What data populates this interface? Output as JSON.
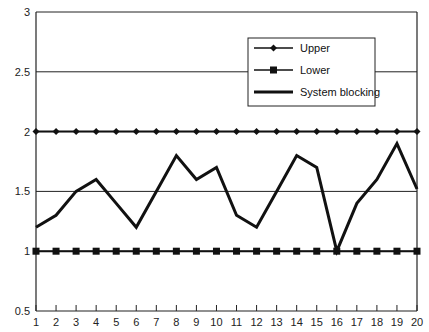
{
  "chart_data": {
    "type": "line",
    "title": "",
    "xlabel": "",
    "ylabel": "",
    "x": [
      1,
      2,
      3,
      4,
      5,
      6,
      7,
      8,
      9,
      10,
      11,
      12,
      13,
      14,
      15,
      16,
      17,
      18,
      19,
      20
    ],
    "ylim": [
      0.5,
      3
    ],
    "yticks": [
      0.5,
      1,
      1.5,
      2,
      2.5,
      3
    ],
    "ytick_labels": [
      "0.5",
      "1",
      "1.5",
      "2",
      "2.5",
      "3"
    ],
    "grid": "horizontal",
    "legend_position": "upper right",
    "series": [
      {
        "name": "Upper",
        "marker": "diamond",
        "values": [
          2,
          2,
          2,
          2,
          2,
          2,
          2,
          2,
          2,
          2,
          2,
          2,
          2,
          2,
          2,
          2,
          2,
          2,
          2,
          2
        ]
      },
      {
        "name": "Lower",
        "marker": "square",
        "values": [
          1,
          1,
          1,
          1,
          1,
          1,
          1,
          1,
          1,
          1,
          1,
          1,
          1,
          1,
          1,
          1,
          1,
          1,
          1,
          1
        ]
      },
      {
        "name": "System blocking",
        "marker": "none",
        "values": [
          1.2,
          1.3,
          1.5,
          1.6,
          1.4,
          1.2,
          1.5,
          1.8,
          1.6,
          1.7,
          1.3,
          1.2,
          1.5,
          1.8,
          1.7,
          1.0,
          1.4,
          1.6,
          1.9,
          1.52
        ]
      }
    ]
  },
  "legend": {
    "items": [
      "Upper",
      "Lower",
      "System blocking"
    ]
  },
  "colors": {
    "line": "#111111",
    "grid": "#222222",
    "background": "#ffffff"
  }
}
